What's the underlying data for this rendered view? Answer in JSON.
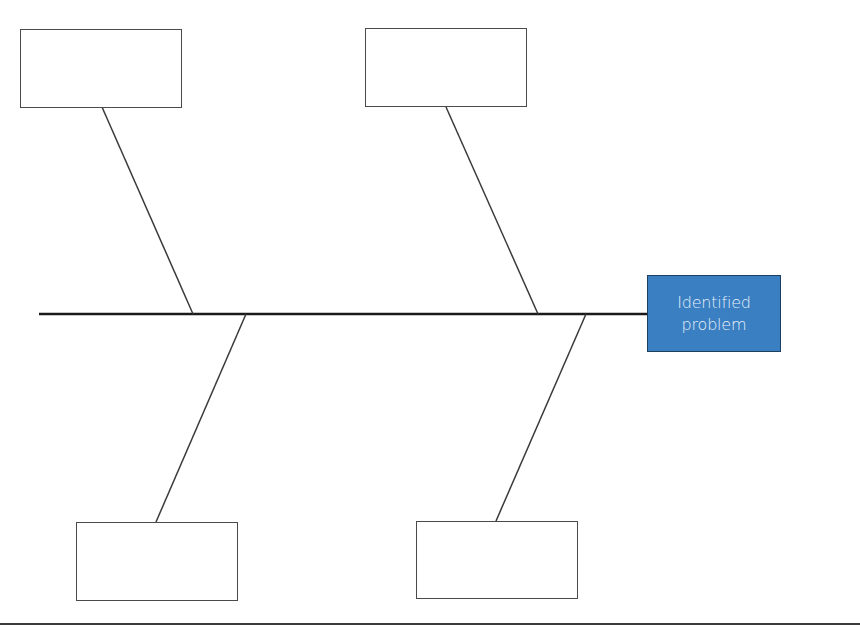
{
  "diagram": {
    "type": "fishbone",
    "effect": {
      "label": "Identified problem",
      "fill_color": "#3a7fc1",
      "text_color": "#e6f0fb"
    },
    "spine": {
      "x1": 39,
      "y1": 314,
      "x2": 647,
      "y2": 314,
      "color": "#1a1a1a"
    },
    "causes": [
      {
        "position": "top-left",
        "label": "",
        "box": {
          "x": 20,
          "y": 29,
          "w": 162,
          "h": 79
        },
        "bone": {
          "x1": 102,
          "y1": 107,
          "x2": 193,
          "y2": 314
        }
      },
      {
        "position": "top-right",
        "label": "",
        "box": {
          "x": 365,
          "y": 28,
          "w": 162,
          "h": 79
        },
        "bone": {
          "x1": 446,
          "y1": 107,
          "x2": 538,
          "y2": 314
        }
      },
      {
        "position": "bottom-left",
        "label": "",
        "box": {
          "x": 76,
          "y": 522,
          "w": 162,
          "h": 79
        },
        "bone": {
          "x1": 246,
          "y1": 314,
          "x2": 156,
          "y2": 522
        }
      },
      {
        "position": "bottom-right",
        "label": "",
        "box": {
          "x": 416,
          "y": 521,
          "w": 162,
          "h": 78
        },
        "bone": {
          "x1": 586,
          "y1": 314,
          "x2": 496,
          "y2": 521
        }
      }
    ],
    "line_color": "#3a3a3a"
  }
}
